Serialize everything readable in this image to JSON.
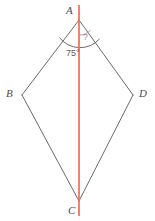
{
  "figure": {
    "type": "geometry-diagram",
    "shape": "kite",
    "width": 155,
    "height": 221,
    "colors": {
      "outline": "#6b6b6b",
      "axis": "#e8543f",
      "known_angle_arc": "#5b5b5b",
      "unknown_angle_arc": "#d9766a",
      "vertex_label": "#4c4c4c",
      "known_angle_text": "#5b5b5b",
      "unknown_angle_text": "#7090b8",
      "background": "#ffffff"
    },
    "vertices": [
      {
        "name": "A",
        "label": "A",
        "x": 79,
        "y": 20,
        "position": "top"
      },
      {
        "name": "B",
        "label": "B",
        "x": 22,
        "y": 95,
        "position": "left"
      },
      {
        "name": "C",
        "label": "C",
        "x": 79,
        "y": 201,
        "position": "bottom"
      },
      {
        "name": "D",
        "label": "D",
        "x": 133,
        "y": 95,
        "position": "right"
      }
    ],
    "edges": [
      {
        "name": "AB",
        "from": "A",
        "to": "B"
      },
      {
        "name": "BC",
        "from": "B",
        "to": "C"
      },
      {
        "name": "CD",
        "from": "C",
        "to": "D"
      },
      {
        "name": "DA",
        "from": "D",
        "to": "A"
      }
    ],
    "axis": {
      "name": "axis-of-symmetry",
      "from": "A",
      "to": "C",
      "x": 79,
      "y_start": 5,
      "y_end": 216,
      "color": "#e8543f"
    },
    "angles": [
      {
        "name": "angle-BAD",
        "vertex": "A",
        "label": "75°",
        "value": 75,
        "unit": "degrees",
        "arc_radius": 26,
        "arc_color": "#5b5b5b"
      },
      {
        "name": "angle-unknown",
        "vertex": "A",
        "label": "?",
        "value": null,
        "arc_radius": 15,
        "arc_color": "#d9766a"
      }
    ]
  }
}
